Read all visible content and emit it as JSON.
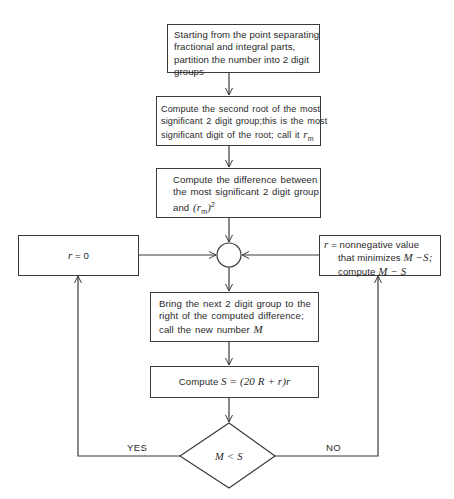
{
  "flowchart": {
    "title": "Square root digit-by-digit algorithm",
    "nodes": {
      "partition": {
        "type": "process",
        "lines": [
          "Starting from the point separating",
          "fractional and integral parts,",
          "partition the number into 2 digit",
          "groups"
        ]
      },
      "first_root": {
        "type": "process",
        "lines": [
          "Compute the second root of the most",
          "significant 2 digit group;this is the most",
          "significant digit of the root; call it"
        ],
        "var": "r",
        "sub": "m"
      },
      "difference": {
        "type": "process",
        "lines": [
          "Compute the difference between",
          "the most significant 2 digit group",
          "and"
        ],
        "expr_open": "(",
        "var": "r",
        "sub": "m",
        "expr_close": ")",
        "sup": "2"
      },
      "junction": {
        "type": "connector"
      },
      "r_zero": {
        "type": "process",
        "var": "r",
        "text": " = 0"
      },
      "r_nonneg": {
        "type": "process",
        "line1_var": "r",
        "line1": " = nonnegative value",
        "line2": "that minimizes ",
        "line2_expr": "M −S;",
        "line3": "compute ",
        "line3_expr": "M − S"
      },
      "next_group": {
        "type": "process",
        "lines": [
          "Bring the next 2 digit group to the",
          "right of the computed difference;",
          "call the new number"
        ],
        "var": "M"
      },
      "compute_s": {
        "type": "process",
        "text": "Compute ",
        "expr": "S = (20 R + r)r"
      },
      "decision": {
        "type": "decision",
        "expr": "M < S"
      }
    },
    "edges": {
      "yes_label": "YES",
      "no_label": "NO"
    }
  }
}
